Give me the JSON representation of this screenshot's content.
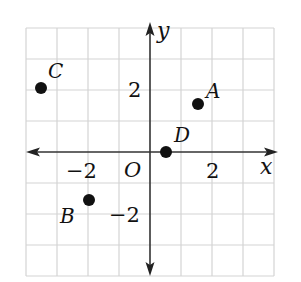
{
  "diagram": {
    "type": "coordinate-plane",
    "axes": {
      "x_label": "x",
      "y_label": "y",
      "origin_label": "O",
      "x_tick_labels": [
        {
          "value": -2,
          "text": "−2"
        },
        {
          "value": 2,
          "text": "2"
        }
      ],
      "y_tick_labels": [
        {
          "value": 2,
          "text": "2"
        },
        {
          "value": -2,
          "text": "−2"
        }
      ]
    },
    "grid": {
      "x_range": [
        -4,
        4
      ],
      "y_range": [
        -4,
        4
      ],
      "step": 1,
      "color": "#d4d4d4"
    },
    "points": [
      {
        "label": "A",
        "x": 1.5,
        "y": 1.5
      },
      {
        "label": "B",
        "x": -2,
        "y": -1.5
      },
      {
        "label": "C",
        "x": -3.5,
        "y": 2
      },
      {
        "label": "D",
        "x": 0.5,
        "y": 0
      }
    ],
    "colors": {
      "axis": "#333333",
      "point": "#111111",
      "grid": "#d4d4d4"
    }
  }
}
